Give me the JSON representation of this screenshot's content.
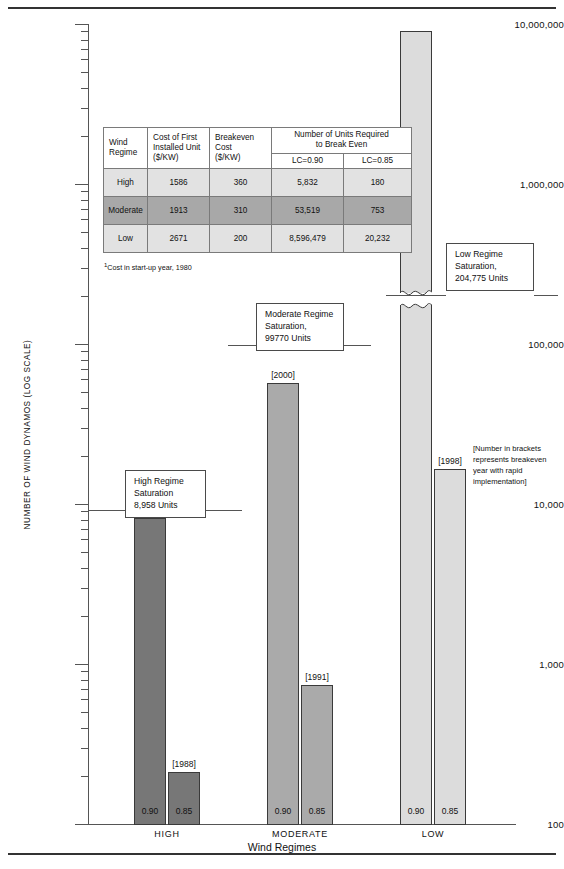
{
  "chart_data": {
    "type": "bar",
    "title": "",
    "xlabel": "Wind Regimes",
    "ylabel": "NUMBER OF WIND DYNAMOS (LOG SCALE)",
    "scale": "log",
    "ylim": [
      100,
      10000000
    ],
    "ytick_labels": [
      "10,000,000",
      "1,000,000",
      "100,000",
      "10,000",
      "1,000",
      "100"
    ],
    "ytick_values": [
      10000000,
      1000000,
      100000,
      10000,
      1000,
      100
    ],
    "grid": false,
    "legend": "none",
    "categories": [
      "HIGH",
      "MODERATE",
      "LOW"
    ],
    "series": [
      {
        "name": "LC=0.90",
        "values": [
          5832,
          53519,
          8596479
        ]
      },
      {
        "name": "LC=0.85",
        "values": [
          180,
          753,
          20232
        ]
      }
    ],
    "bar_annotations": [
      {
        "category": "HIGH",
        "series": "LC=0.90",
        "label": "[1993]"
      },
      {
        "category": "HIGH",
        "series": "LC=0.85",
        "label": "[1988]"
      },
      {
        "category": "MODERATE",
        "series": "LC=0.90",
        "label": "[2000]"
      },
      {
        "category": "MODERATE",
        "series": "LC=0.85",
        "label": "[1991]"
      },
      {
        "category": "LOW",
        "series": "LC=0.90",
        "label": ""
      },
      {
        "category": "LOW",
        "series": "LC=0.85",
        "label": "[1998]"
      }
    ],
    "bar_foot_labels": [
      "0.90",
      "0.85",
      "0.90",
      "0.85",
      "0.90",
      "0.85"
    ],
    "saturation_lines": [
      {
        "regime": "High",
        "value": 8958,
        "label": "8,958 Units"
      },
      {
        "regime": "Moderate",
        "value": 99770,
        "label": "99770 Units"
      },
      {
        "regime": "Low",
        "value": 204775,
        "label": "204,775 Units"
      }
    ],
    "colors": {
      "high_bar": "#777777",
      "moderate_bar": "#aaaaaa",
      "low_bar": "#dcdcdc",
      "axis": "#555555",
      "text": "#111111"
    }
  },
  "axis": {
    "y_title": "NUMBER OF WIND DYNAMOS (LOG SCALE)",
    "x_title": "Wind Regimes",
    "y_labels": {
      "l7": "10,000,000",
      "l6": "1,000,000",
      "l5": "100,000",
      "l4": "10,000",
      "l3": "1,000",
      "l2": "100"
    }
  },
  "groups": {
    "high": "HIGH",
    "moderate": "MODERATE",
    "low": "LOW"
  },
  "bars": {
    "high_090": {
      "foot": "0.90",
      "top": "[1993]"
    },
    "high_085": {
      "foot": "0.85",
      "top": "[1988]"
    },
    "mod_090": {
      "foot": "0.90",
      "top": "[2000]"
    },
    "mod_085": {
      "foot": "0.85",
      "top": "[1991]"
    },
    "low_090": {
      "foot": "0.90",
      "top": ""
    },
    "low_085": {
      "foot": "0.85",
      "top": "[1998]"
    }
  },
  "callouts": {
    "high": {
      "line1": "High Regime",
      "line2": "Saturation",
      "line3": "8,958 Units"
    },
    "moderate": {
      "line1": "Moderate Regime",
      "line2": "Saturation,",
      "line3": "99770 Units"
    },
    "low": {
      "line1": "Low Regime",
      "line2": "Saturation,",
      "line3": "204,775 Units"
    }
  },
  "bracket_note": "[Number in brackets represents breakeven year with rapid implementation]",
  "table": {
    "headers": {
      "regime_l1": "Wind",
      "regime_l2": "Regime",
      "cost_l1": "Cost of First",
      "cost_l2": "Installed Unit",
      "cost_l3": "($/KW)",
      "breakeven_l1": "Breakeven Cost",
      "breakeven_l2": "($/KW)",
      "units_l1": "Number of Units Required",
      "units_l2": "to Break Even",
      "lc090": "LC=0.90",
      "lc085": "LC=0.85"
    },
    "rows": [
      {
        "regime": "High",
        "cost": "1586",
        "breakeven": "360",
        "lc090": "5,832",
        "lc085": "180"
      },
      {
        "regime": "Moderate",
        "cost": "1913",
        "breakeven": "310",
        "lc090": "53,519",
        "lc085": "753"
      },
      {
        "regime": "Low",
        "cost": "2671",
        "breakeven": "200",
        "lc090": "8,596,479",
        "lc085": "20,232"
      }
    ],
    "footnote": "Cost in start-up year, 1980",
    "footnote_marker": "1"
  }
}
